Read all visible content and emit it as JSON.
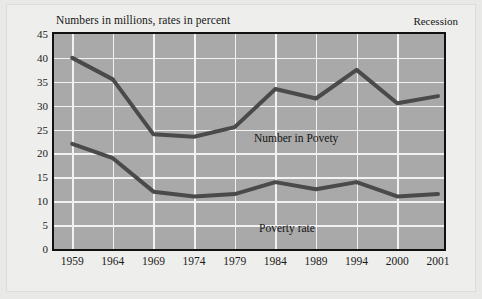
{
  "figure": {
    "title": "Numbers in millions, rates in percent",
    "recession_label": "Recession"
  },
  "colors": {
    "plot_background": "#a9a9a9",
    "gridline": "#f2f2f2",
    "frame": "#111111",
    "series_line": "#4a4a4a",
    "page_background": "#eeeeec",
    "text": "#161616"
  },
  "chart_data": {
    "type": "line",
    "title": "Numbers in millions, rates in percent",
    "xlabel": "",
    "ylabel": "",
    "ylim": [
      0,
      45
    ],
    "ytick_labels": [
      "0",
      "5",
      "10",
      "15",
      "20",
      "25",
      "30",
      "35",
      "40",
      "45"
    ],
    "ytick_values": [
      0,
      5,
      10,
      15,
      20,
      25,
      30,
      35,
      40,
      45
    ],
    "categories": [
      "1959",
      "1964",
      "1969",
      "1974",
      "1979",
      "1984",
      "1989",
      "1994",
      "2000",
      "2001"
    ],
    "grid": true,
    "grid_axes": "both",
    "legend": "inline-annotations",
    "annotations": [
      {
        "text": "Recession",
        "position": "top-right-outside"
      }
    ],
    "series": [
      {
        "name": "Number in Povety",
        "label": "Number in Povety",
        "unit": "millions",
        "values": [
          40.0,
          35.5,
          24.0,
          23.5,
          25.5,
          33.5,
          31.5,
          37.5,
          30.5,
          32.0
        ]
      },
      {
        "name": "Poverty rate",
        "label": "Poverty rate",
        "unit": "percent",
        "values": [
          22.0,
          19.0,
          12.0,
          11.0,
          11.5,
          14.0,
          12.5,
          14.0,
          11.0,
          11.5
        ]
      }
    ]
  }
}
